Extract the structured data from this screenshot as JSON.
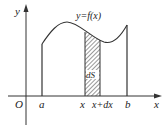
{
  "figure": {
    "curve_label": "y=f(x)",
    "strip_label": "dS",
    "axes": {
      "y_label": "y",
      "x_label": "x",
      "origin_label": "O"
    },
    "ticks": {
      "a": "a",
      "x": "x",
      "x_plus_dx": "x+dx",
      "b": "b"
    },
    "colors": {
      "stroke": "#333333",
      "hatch": "#444444",
      "background": "#ffffff"
    }
  }
}
